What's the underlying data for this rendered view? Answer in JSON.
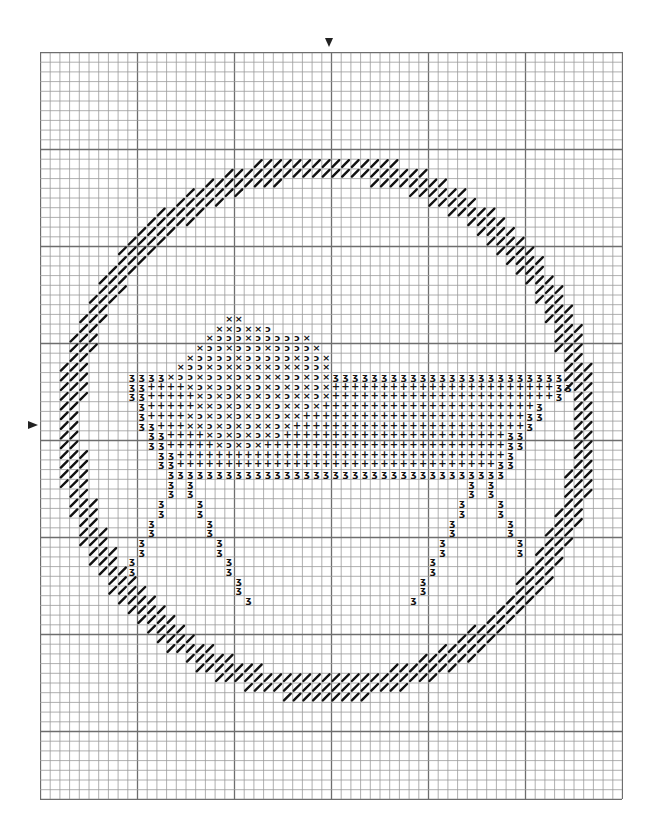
{
  "pattern": {
    "grid": {
      "cols": 60,
      "rows": 77,
      "cell_px": 9.7,
      "major_every": 10,
      "center_col": 30,
      "center_row": 38.5,
      "line_color": "#9a9a9a",
      "major_line_color": "#6e6e6e"
    },
    "center_markers": {
      "top": "center-column-arrow",
      "left": "center-row-arrow"
    },
    "legend_symbols": {
      "x": "×",
      "c": "ↄ",
      "p": "+",
      "z": "ʒ",
      "slash": "/"
    },
    "ring": {
      "stitch": "slash",
      "center_col": 29.6,
      "center_row": 38.7,
      "outer_radius_cols": 27.8,
      "outer_radius_rows": 28.2,
      "thickness_cells": 2.6
    },
    "manger_rows": [
      {
        "row": 27,
        "start": 19,
        "cells": "xx"
      },
      {
        "row": 28,
        "start": 18,
        "cells": "xxcxxc"
      },
      {
        "row": 29,
        "start": 17,
        "cells": "xcccxcccccx"
      },
      {
        "row": 30,
        "start": 16,
        "cells": "xccxcccxccccx"
      },
      {
        "row": 31,
        "start": 15,
        "cells": "xccccxcccccxccx"
      },
      {
        "row": 32,
        "start": 14,
        "cells": "xccxcxxcxxcxxccx"
      },
      {
        "row": 33,
        "start": 9,
        "cells": "zzzzxccxccxcxcxxccxcxzzzzzzzzzzzzzzzzzzzzzzzz"
      },
      {
        "row": 34,
        "start": 9,
        "cells": "zzppppxcxccxccxcxcxcxpppppppppppppppppppppppzz"
      },
      {
        "row": 35,
        "start": 9,
        "cells": "zzpppppxcxcxcxcxcxxcxpppppppppppppppppppppppz"
      },
      {
        "row": 36,
        "start": 10,
        "cells": "zpppppxxcxcxcxcxxcxppppppppppppppppppppppz"
      },
      {
        "row": 37,
        "start": 10,
        "cells": "zppppxcxcxcxcxcxxpppppppppppppppppppppppzz"
      },
      {
        "row": 38,
        "start": 10,
        "cells": "zzpppxxcxcxcxxcxppppppppppppppppppppppppz"
      },
      {
        "row": 39,
        "start": 11,
        "cells": "zzppppxcxcxcxcpppppppppppppppppppppppzz"
      },
      {
        "row": 40,
        "start": 11,
        "cells": "zzpppppxcxcxpppppppppppppppppppppppppzz"
      },
      {
        "row": 41,
        "start": 12,
        "cells": "zzppppppppppppppppppppppppppppppppppz"
      },
      {
        "row": 42,
        "start": 12,
        "cells": "zzpppppppppppppppppppppppppppppppppzz"
      },
      {
        "row": 43,
        "start": 13,
        "cells": "zzzzzzzzzzzzzzzzzzzzzzzzzzzzzzzzzzz"
      }
    ],
    "legs": {
      "symbol": "z",
      "left_outer": [
        [
          44,
          13
        ],
        [
          45,
          13
        ],
        [
          46,
          12
        ],
        [
          47,
          12
        ],
        [
          48,
          11
        ],
        [
          49,
          11
        ],
        [
          50,
          10
        ],
        [
          51,
          10
        ],
        [
          52,
          9
        ],
        [
          53,
          9
        ]
      ],
      "left_inner": [
        [
          44,
          15
        ],
        [
          45,
          15
        ],
        [
          46,
          16
        ],
        [
          47,
          16
        ],
        [
          48,
          17
        ],
        [
          49,
          17
        ],
        [
          50,
          18
        ],
        [
          51,
          18
        ],
        [
          52,
          19
        ],
        [
          53,
          19
        ],
        [
          54,
          20
        ],
        [
          55,
          20
        ],
        [
          56,
          21
        ]
      ],
      "right_outer": [
        [
          44,
          46
        ],
        [
          45,
          46
        ],
        [
          46,
          47
        ],
        [
          47,
          47
        ],
        [
          48,
          48
        ],
        [
          49,
          48
        ],
        [
          50,
          49
        ],
        [
          51,
          49
        ]
      ],
      "right_inner": [
        [
          44,
          44
        ],
        [
          45,
          44
        ],
        [
          46,
          43
        ],
        [
          47,
          43
        ],
        [
          48,
          42
        ],
        [
          49,
          42
        ],
        [
          50,
          41
        ],
        [
          51,
          41
        ],
        [
          52,
          40
        ],
        [
          53,
          40
        ],
        [
          54,
          39
        ],
        [
          55,
          39
        ],
        [
          56,
          38
        ]
      ]
    }
  }
}
